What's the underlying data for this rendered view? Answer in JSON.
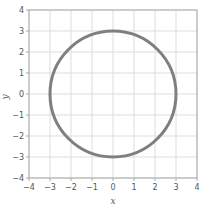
{
  "chart_data": {
    "type": "line",
    "title": "",
    "xlabel": "x",
    "ylabel": "y",
    "xlim": [
      -4,
      4
    ],
    "ylim": [
      -4,
      4
    ],
    "x_ticks": [
      -4,
      -3,
      -2,
      -1,
      0,
      1,
      2,
      3,
      4
    ],
    "y_ticks": [
      -4,
      -3,
      -2,
      -1,
      0,
      1,
      2,
      3,
      4
    ],
    "x_tick_labels": [
      "−4",
      "−3",
      "−2",
      "−1",
      "0",
      "1",
      "2",
      "3",
      "4"
    ],
    "y_tick_labels": [
      "−4",
      "−3",
      "−2",
      "−1",
      "0",
      "1",
      "2",
      "3",
      "4"
    ],
    "grid": true,
    "legend": null,
    "series": [
      {
        "name": "circle",
        "shape": "circle",
        "center": [
          0,
          0
        ],
        "radius": 3,
        "equation": "x^2 + y^2 = 9",
        "color": "#7f7f7f"
      }
    ]
  },
  "colors": {
    "curve": "#7f7f7f",
    "grid": "#dddddd",
    "axis": "#aaaaaa",
    "text": "#555555"
  }
}
